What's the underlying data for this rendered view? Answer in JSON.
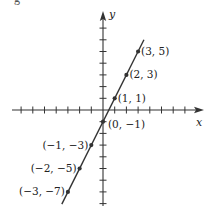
{
  "chart_data": {
    "type": "scatter",
    "title": "",
    "xlabel": "x",
    "ylabel": "y",
    "equation": "y = 2x - 1",
    "xlim": [
      -8,
      8
    ],
    "ylim": [
      -8,
      8
    ],
    "grid": false,
    "legend": null,
    "series": [
      {
        "name": "line",
        "points": [
          {
            "x": -3,
            "y": -7,
            "label": "(−3, −7)",
            "label_side": "left"
          },
          {
            "x": -2,
            "y": -5,
            "label": "(−2, −5)",
            "label_side": "left"
          },
          {
            "x": -1,
            "y": -3,
            "label": "(−1, −3)",
            "label_side": "left"
          },
          {
            "x": 0,
            "y": -1,
            "label": "(0, −1)",
            "label_side": "right"
          },
          {
            "x": 1,
            "y": 1,
            "label": "(1, 1)",
            "label_side": "right"
          },
          {
            "x": 2,
            "y": 3,
            "label": "(2, 3)",
            "label_side": "right"
          },
          {
            "x": 3,
            "y": 5,
            "label": "(3, 5)",
            "label_side": "right"
          }
        ]
      }
    ],
    "colors": {
      "line": "#333333",
      "axis": "#333333",
      "text": "#222222"
    }
  },
  "header": {
    "cropped_text": "g"
  }
}
